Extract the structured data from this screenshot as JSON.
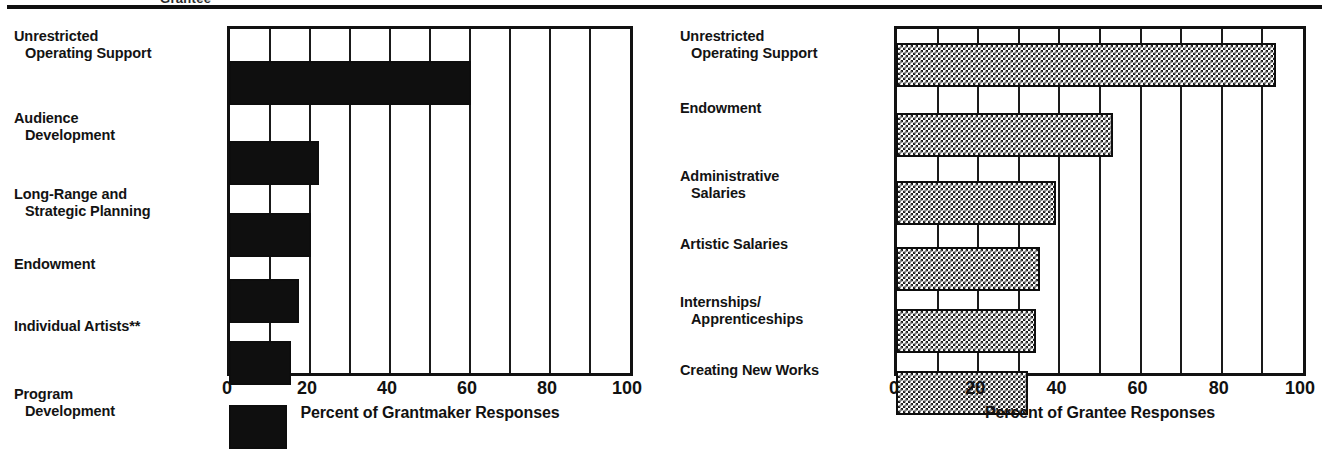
{
  "figure": {
    "cropped_title": "Grantee",
    "divider": "horizontal-rule"
  },
  "chart_data": [
    {
      "id": "grantmaker",
      "type": "bar",
      "orientation": "horizontal",
      "title": "",
      "xlabel": "Percent of Grantmaker Responses",
      "ylabel": "",
      "xlim": [
        0,
        100
      ],
      "xticks": [
        0,
        20,
        40,
        60,
        80,
        100
      ],
      "gridlines": [
        10,
        20,
        30,
        40,
        50,
        60,
        70,
        80,
        90
      ],
      "grid": true,
      "legend": "none",
      "bar_fill": "solid-black",
      "bar_color": "#0f0f0f",
      "categories": [
        "Unrestricted Operating Support",
        "Audience Development",
        "Long-Range and Strategic Planning",
        "Endowment",
        "Individual Artists**",
        "Program Development"
      ],
      "category_lines": [
        [
          "Unrestricted",
          "Operating Support"
        ],
        [
          "Audience",
          "Development"
        ],
        [
          "Long-Range and",
          "Strategic Planning"
        ],
        [
          "Endowment",
          ""
        ],
        [
          "Individual Artists**",
          ""
        ],
        [
          "Program",
          "Development"
        ]
      ],
      "values": [
        60,
        22,
        20,
        17,
        15,
        14
      ]
    },
    {
      "id": "grantee",
      "type": "bar",
      "orientation": "horizontal",
      "title": "",
      "xlabel": "Percent of Grantee Responses",
      "ylabel": "",
      "xlim": [
        0,
        100
      ],
      "xticks": [
        0,
        20,
        40,
        60,
        80,
        100
      ],
      "gridlines": [
        10,
        20,
        30,
        40,
        50,
        60,
        70,
        80,
        90
      ],
      "grid": true,
      "legend": "none",
      "bar_fill": "checkerboard",
      "bar_color": "#1b1b1b",
      "categories": [
        "Unrestricted Operating Support",
        "Endowment",
        "Administrative Salaries",
        "Artistic Salaries",
        "Internships/Apprenticeships",
        "Creating New Works"
      ],
      "category_lines": [
        [
          "Unrestricted",
          "Operating Support"
        ],
        [
          "Endowment",
          ""
        ],
        [
          "Administrative",
          "Salaries"
        ],
        [
          "Artistic Salaries",
          ""
        ],
        [
          "Internships/",
          "Apprenticeships"
        ],
        [
          "Creating New Works",
          ""
        ]
      ],
      "values": [
        93,
        53,
        39,
        35,
        34,
        32
      ]
    }
  ]
}
